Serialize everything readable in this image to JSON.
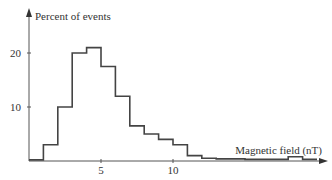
{
  "chart_data": {
    "type": "bar",
    "subtype": "histogram-step",
    "title": "",
    "xlabel": "Magnetic field (nT)",
    "ylabel": "Percent of events",
    "xlim": [
      0,
      20
    ],
    "ylim": [
      0,
      25
    ],
    "x_ticks": [
      5,
      10
    ],
    "x_tick_labels": [
      "5",
      "10"
    ],
    "y_ticks": [
      10,
      20
    ],
    "y_tick_labels": [
      "10",
      "20"
    ],
    "grid": false,
    "legend": null,
    "bin_edges": [
      0,
      1,
      2,
      3,
      4,
      5,
      6,
      7,
      8,
      9,
      10,
      11,
      12,
      13,
      14,
      15,
      16,
      17,
      18,
      19,
      20
    ],
    "values": [
      0.2,
      3,
      10,
      20,
      21,
      17.5,
      12,
      6.5,
      5,
      4,
      3,
      1,
      0.5,
      0.4,
      0.4,
      0.3,
      0.3,
      0.3,
      0.8,
      0.3
    ]
  }
}
